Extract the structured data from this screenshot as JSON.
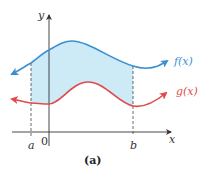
{
  "figure": {
    "caption": "(a)",
    "axes": {
      "x_label": "x",
      "y_label": "y",
      "origin_label": "0"
    },
    "ticks": {
      "a": "a",
      "b": "b"
    },
    "curves": [
      {
        "name": "f",
        "label": "f(x)",
        "color": "#3a8fcf"
      },
      {
        "name": "g",
        "label": "g(x)",
        "color": "#e04a4a"
      }
    ],
    "shaded_region": {
      "description": "area between f(x) and g(x) from a to b",
      "color": "#cdeaf7"
    }
  }
}
